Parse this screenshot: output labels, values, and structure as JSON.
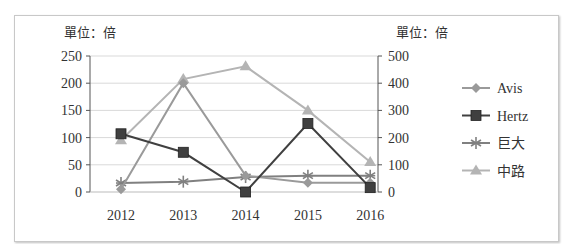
{
  "chart_data": {
    "type": "line",
    "title": "",
    "left_unit_label": "單位：倍",
    "right_unit_label": "單位：倍",
    "xlabel": "",
    "ylabel_left": "單位：倍",
    "ylabel_right": "單位：倍",
    "categories": [
      "2012",
      "2013",
      "2014",
      "2015",
      "2016"
    ],
    "y_left": {
      "ylim": [
        0,
        250
      ],
      "ticks": [
        "0",
        "50",
        "100",
        "150",
        "200",
        "250"
      ]
    },
    "y_right": {
      "ylim": [
        0,
        500
      ],
      "ticks": [
        "0",
        "100",
        "200",
        "300",
        "400",
        "500"
      ]
    },
    "grid": true,
    "legend_position": "right",
    "series": [
      {
        "name": "Avis",
        "axis": "left",
        "marker": "diamond",
        "color": "#9a9a9a",
        "values": [
          5,
          200,
          30,
          17,
          17
        ]
      },
      {
        "name": "Hertz",
        "axis": "left",
        "marker": "square",
        "color": "#404040",
        "values": [
          107,
          73,
          0,
          126,
          8
        ]
      },
      {
        "name": "巨大",
        "axis": "right",
        "marker": "asterisk",
        "color": "#808080",
        "values": [
          33,
          38,
          55,
          60,
          60
        ]
      },
      {
        "name": "中路",
        "axis": "right",
        "marker": "triangle",
        "color": "#b4b4b4",
        "values": [
          190,
          415,
          462,
          300,
          110
        ]
      }
    ]
  }
}
